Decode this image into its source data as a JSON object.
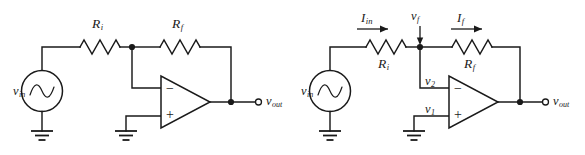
{
  "figure": {
    "background_color": "#ffffff",
    "line_color": "#1a1a1a"
  },
  "circuits": [
    {
      "id": "left",
      "name": "inverting-amplifier-basic",
      "labels": {
        "source": {
          "symbol": "v",
          "sub": "in"
        },
        "r_input": {
          "symbol": "R",
          "sub": "i"
        },
        "r_feedback": {
          "symbol": "R",
          "sub": "f"
        },
        "output": {
          "symbol": "v",
          "sub": "out"
        },
        "op_minus": "−",
        "op_plus": "+"
      }
    },
    {
      "id": "right",
      "name": "inverting-amplifier-annotated",
      "labels": {
        "source": {
          "symbol": "v",
          "sub": "in"
        },
        "r_input": {
          "symbol": "R",
          "sub": "i"
        },
        "r_feedback": {
          "symbol": "R",
          "sub": "f"
        },
        "output": {
          "symbol": "v",
          "sub": "out"
        },
        "current_in": {
          "symbol": "I",
          "sub": "in"
        },
        "current_f": {
          "symbol": "I",
          "sub": "f"
        },
        "node_vf": {
          "symbol": "v",
          "sub": "f"
        },
        "inverting_input": {
          "symbol": "v",
          "sub": "2"
        },
        "noninverting_input": {
          "symbol": "v",
          "sub": "1"
        },
        "op_minus": "−",
        "op_plus": "+"
      }
    }
  ]
}
